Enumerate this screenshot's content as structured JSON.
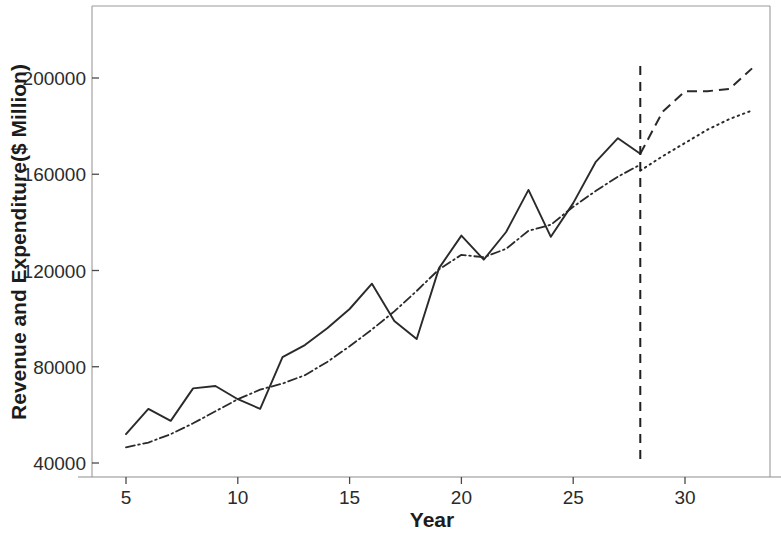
{
  "chart_data": {
    "type": "line",
    "title": "",
    "xlabel": "Year",
    "ylabel": "Revenue and Expenditure($ Million)",
    "xlim": [
      3.4,
      33.9
    ],
    "ylim": [
      28000,
      218000
    ],
    "xticks": [
      5,
      10,
      15,
      20,
      25,
      30
    ],
    "xtick_labels": [
      "5",
      "10",
      "15",
      "20",
      "25",
      "30"
    ],
    "yticks": [
      40000,
      80000,
      120000,
      160000,
      200000
    ],
    "ytick_labels": [
      "40000",
      "80000",
      "120000",
      "160000",
      "200000"
    ],
    "grid": false,
    "legend": "none",
    "annotations": [
      {
        "name": "forecast-cutoff",
        "type": "vertical-dashed-line",
        "x": 28,
        "y_from": 40000,
        "y_to": 205000
      }
    ],
    "series": [
      {
        "name": "Revenue (observed)",
        "style": "solid",
        "x": [
          5,
          6,
          7,
          8,
          9,
          10,
          11,
          12,
          13,
          14,
          15,
          16,
          17,
          18,
          19,
          20,
          21,
          22,
          23,
          24,
          25,
          26,
          27,
          28
        ],
        "values": [
          52000,
          62500,
          57500,
          71000,
          72000,
          66500,
          62500,
          84000,
          89000,
          96000,
          104000,
          114500,
          99000,
          91500,
          121000,
          134500,
          124500,
          136000,
          153500,
          134000,
          148000,
          165000,
          175000,
          168500
        ]
      },
      {
        "name": "Expenditure (fitted)",
        "style": "dash-dot",
        "x": [
          5,
          6,
          7,
          8,
          9,
          10,
          11,
          12,
          13,
          14,
          15,
          16,
          17,
          18,
          19,
          20,
          21,
          22,
          23,
          24,
          25,
          26,
          27,
          28
        ],
        "values": [
          46500,
          48500,
          52000,
          56500,
          61500,
          66500,
          70500,
          73000,
          76500,
          82000,
          88500,
          95500,
          103000,
          111500,
          120500,
          126500,
          125500,
          129000,
          136500,
          139000,
          146500,
          153000,
          159000,
          164000
        ]
      },
      {
        "name": "Revenue forecast",
        "style": "dashed",
        "x": [
          28,
          29,
          30,
          31,
          32,
          33
        ],
        "values": [
          168500,
          186000,
          194500,
          194500,
          195500,
          204000
        ]
      },
      {
        "name": "Expenditure forecast",
        "style": "dotted",
        "x": [
          28,
          29,
          30,
          31,
          32,
          33
        ],
        "values": [
          161500,
          167500,
          173000,
          178500,
          183000,
          186500
        ]
      }
    ]
  },
  "axis": {
    "x_title": "Year",
    "y_title": "Revenue and Expenditure($ Million)"
  }
}
